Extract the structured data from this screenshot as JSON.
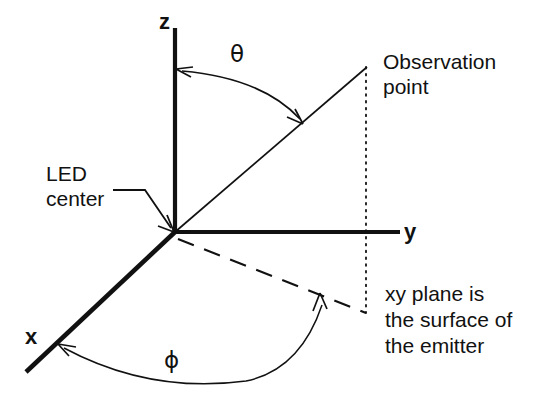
{
  "figure": {
    "kind": "spherical-coordinate-diagram",
    "background_color": "#ffffff",
    "stroke_color": "#111111",
    "axes": {
      "z_label": "z",
      "y_label": "y",
      "x_label": "x"
    },
    "angles": {
      "polar_symbol": "θ",
      "azimuth_symbol": "ϕ"
    },
    "labels": {
      "led_center_line1": "LED",
      "led_center_line2": "center",
      "observation_line1": "Observation",
      "observation_line2": "point",
      "note_line1": "xy plane is",
      "note_line2": "the surface of",
      "note_line3": "the emitter"
    }
  }
}
